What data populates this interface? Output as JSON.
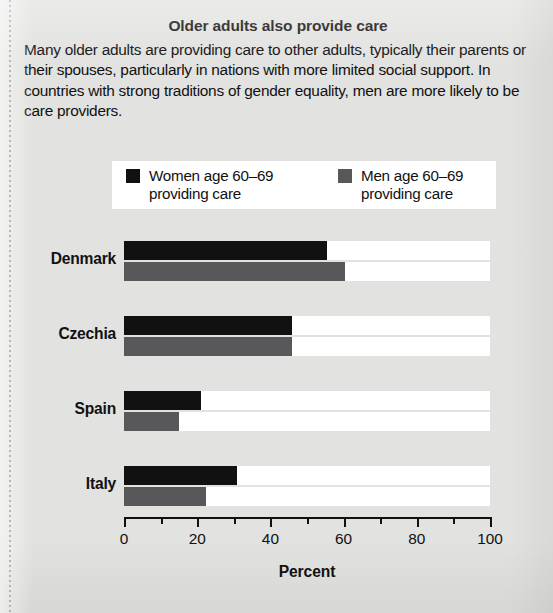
{
  "title": "Older adults also provide care",
  "blurb": "Many older adults are providing care to other adults, typically their parents or their spouses, particularly in nations with more limited social support. In countries with strong traditions of gender equality, men are more likely to be care providers.",
  "legend": {
    "women_label_line1": "Women age 60–69",
    "women_label_line2": "providing care",
    "men_label_line1": "Men age 60–69",
    "men_label_line2": "providing care"
  },
  "colors": {
    "women": "#111111",
    "men": "#58585a",
    "plot_band": "#ffffff",
    "page_background": "#e2e2e0"
  },
  "axis": {
    "title": "Percent",
    "tick_labels": [
      "0",
      "20",
      "40",
      "60",
      "80",
      "100"
    ]
  },
  "chart_data": {
    "type": "bar",
    "orientation": "horizontal",
    "title": "Older adults also provide care",
    "xlabel": "Percent",
    "ylabel": "",
    "xlim": [
      0,
      100
    ],
    "xticks": [
      0,
      10,
      20,
      30,
      40,
      50,
      60,
      70,
      80,
      90,
      100
    ],
    "xtick_labels_shown": [
      0,
      20,
      40,
      60,
      80,
      100
    ],
    "grid": false,
    "legend_position": "top",
    "categories": [
      "Denmark",
      "Czechia",
      "Spain",
      "Italy"
    ],
    "series": [
      {
        "name": "Women age 60–69 providing care",
        "color": "#111111",
        "values": [
          55.5,
          46,
          21,
          31
        ]
      },
      {
        "name": "Men age 60–69 providing care",
        "color": "#58585a",
        "values": [
          60.5,
          46,
          15,
          22.5
        ]
      }
    ]
  }
}
